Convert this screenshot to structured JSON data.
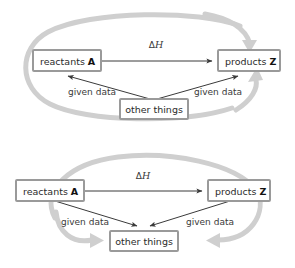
{
  "figure": {
    "background_color": "#ffffff",
    "box_border_color": "#9a9a9a",
    "box_fill_color": "#ffffff",
    "black_arrow_color": "#3a3a3a",
    "grey_arrow_color": "#cfcfcf",
    "text_color": "#2b2b2b"
  },
  "diagrams": [
    {
      "id": "top-diagram",
      "nodes": {
        "reactants": {
          "text": "reactants ",
          "symbol": "A"
        },
        "products": {
          "text": "products ",
          "symbol": "Z"
        },
        "other": {
          "text": "other things"
        }
      },
      "edges": {
        "enthalpy": {
          "label": "ΔH"
        },
        "left_given": {
          "label": "given data"
        },
        "right_given": {
          "label": "given data"
        }
      }
    },
    {
      "id": "bottom-diagram",
      "nodes": {
        "reactants": {
          "text": "reactants ",
          "symbol": "A"
        },
        "products": {
          "text": "products ",
          "symbol": "Z"
        },
        "other": {
          "text": "other things"
        }
      },
      "edges": {
        "enthalpy": {
          "label": "ΔH"
        },
        "left_given": {
          "label": "given data"
        },
        "right_given": {
          "label": "given data"
        }
      }
    }
  ]
}
